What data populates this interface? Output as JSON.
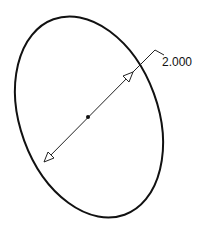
{
  "drawing": {
    "shape": "ellipse",
    "dimension": {
      "type": "diameter",
      "value": "2.000"
    },
    "colors": {
      "outline": "#111111",
      "dimension_line": "#222222",
      "background": "#ffffff"
    }
  }
}
